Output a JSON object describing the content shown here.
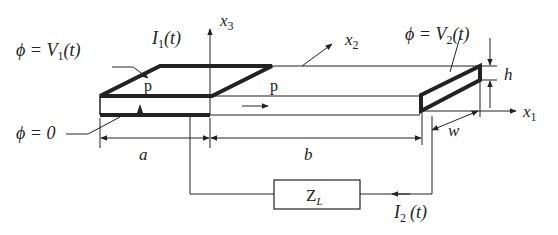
{
  "labels": {
    "phi_v1": "ϕ = V",
    "phi_v1_sub": "1",
    "phi_v1_arg": "(t)",
    "i1": "I",
    "i1_sub": "1",
    "i1_arg": "(t)",
    "x3": "x",
    "x3_sub": "3",
    "x2": "x",
    "x2_sub": "2",
    "phi_v2": "ϕ = V",
    "phi_v2_sub": "2",
    "phi_v2_arg": "(t)",
    "h": "h",
    "x1": "x",
    "x1_sub": "1",
    "phi_0": "ϕ = 0",
    "p_left": "p",
    "p_right": "p",
    "a": "a",
    "b": "b",
    "w": "w",
    "zl": "Z",
    "zl_sub": "L",
    "i2": "I",
    "i2_sub": "2",
    "i2_arg": "(t)"
  },
  "colors": {
    "stroke": "#222222",
    "background": "#ffffff"
  }
}
